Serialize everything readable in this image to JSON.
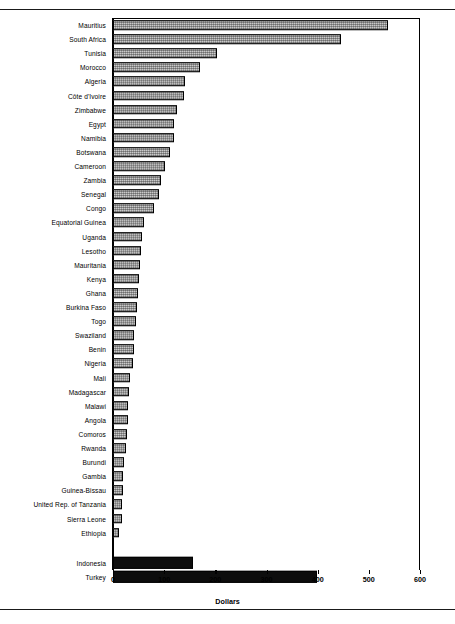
{
  "chart_data": {
    "type": "bar",
    "orientation": "horizontal",
    "title": "",
    "xlabel": "Dollars",
    "ylabel": "",
    "xlim": [
      0,
      600
    ],
    "xticks": [
      0,
      100,
      200,
      300,
      400,
      500,
      600
    ],
    "grid": false,
    "legend": null,
    "series": [
      {
        "name": "Africa",
        "style": "hatched-gray",
        "categories": [
          "Mauritius",
          "South Africa",
          "Tunisia",
          "Morocco",
          "Algeria",
          "Côte d'Ivoire",
          "Zimbabwe",
          "Egypt",
          "Namibia",
          "Botswana",
          "Cameroon",
          "Zambia",
          "Senegal",
          "Congo",
          "Equatorial Guinea",
          "Uganda",
          "Lesotho",
          "Mauritania",
          "Kenya",
          "Ghana",
          "Burkina Faso",
          "Togo",
          "Swaziland",
          "Benin",
          "Nigeria",
          "Mali",
          "Madagascar",
          "Malawi",
          "Angola",
          "Comoros",
          "Rwanda",
          "Burundi",
          "Gambia",
          "Guinea-Bissau",
          "United Rep. of Tanzania",
          "Sierra Leone",
          "Ethiopia"
        ],
        "values": [
          537,
          445,
          203,
          170,
          141,
          139,
          126,
          120,
          119,
          111,
          102,
          93,
          89,
          80,
          61,
          57,
          55,
          53,
          51,
          48,
          46,
          45,
          42,
          41,
          39,
          33,
          31,
          30,
          29,
          27,
          26,
          22,
          20,
          19,
          18,
          17,
          11
        ]
      },
      {
        "name": "Comparison countries",
        "style": "solid-black",
        "categories": [
          "Indonesia",
          "Turkey"
        ],
        "values": [
          156,
          398
        ]
      }
    ]
  },
  "axis": {
    "unit_label": "Dollars",
    "tick_labels": [
      "0",
      "100",
      "200",
      "300",
      "400",
      "500",
      "600"
    ]
  }
}
